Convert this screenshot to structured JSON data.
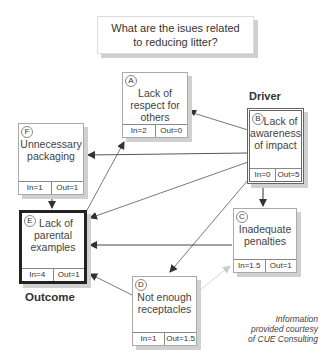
{
  "title": {
    "line1": "What are the isues related",
    "line2": "to reducing litter?"
  },
  "nodes": {
    "A": {
      "letter": "A",
      "lines": [
        "Lack of",
        "respect for",
        "others"
      ],
      "in": "In=2",
      "out": "Out=0"
    },
    "B": {
      "letter": "B",
      "lines": [
        "Lack of",
        "awareness",
        "of impact"
      ],
      "in": "In=0",
      "out": "Out=5"
    },
    "C": {
      "letter": "C",
      "lines": [
        "Inadequate",
        "penalties"
      ],
      "in": "In=1.5",
      "out": "Out=1"
    },
    "D": {
      "letter": "D",
      "lines": [
        "Not enough",
        "receptacles"
      ],
      "in": "In=1",
      "out": "Out=1.5"
    },
    "E": {
      "letter": "E",
      "lines": [
        "Lack of",
        "parental",
        "examples"
      ],
      "in": "In=4",
      "out": "Out=1"
    },
    "F": {
      "letter": "F",
      "lines": [
        "Unnecessary",
        "packaging"
      ],
      "in": "In=1",
      "out": "Out=1"
    }
  },
  "labels": {
    "driver": "Driver",
    "outcome": "Outcome"
  },
  "credit": {
    "line1": "Information",
    "line2": "provided courtesy",
    "line3": "of CUE Consulting"
  },
  "edges": [
    {
      "from": "B",
      "to": "F"
    },
    {
      "from": "B",
      "to": "A"
    },
    {
      "from": "B",
      "to": "E"
    },
    {
      "from": "B",
      "to": "C"
    },
    {
      "from": "B",
      "to": "D"
    },
    {
      "from": "F",
      "to": "E"
    },
    {
      "from": "E",
      "to": "A"
    },
    {
      "from": "C",
      "to": "E"
    },
    {
      "from": "D",
      "to": "E"
    },
    {
      "from": "D",
      "to": "C"
    }
  ],
  "colors": {
    "edge": "#555555",
    "edge_light": "#bbbbbb",
    "shadow": "#d0d0d0"
  }
}
